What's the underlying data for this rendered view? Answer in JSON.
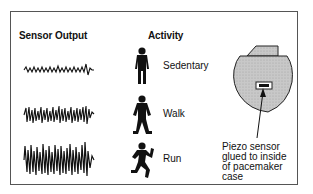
{
  "headers": {
    "sensor_output": "Sensor Output",
    "activity": "Activity"
  },
  "rows": [
    {
      "activity": "Sedentary",
      "icon": "standing-person-icon",
      "signal_amplitude": "low"
    },
    {
      "activity": "Walk",
      "icon": "walking-person-icon",
      "signal_amplitude": "medium"
    },
    {
      "activity": "Run",
      "icon": "running-person-icon",
      "signal_amplitude": "high"
    }
  ],
  "pacemaker": {
    "icon": "pacemaker-icon",
    "note_lines": [
      "Piezo sensor",
      "glued to inside",
      "of pacemaker",
      "case"
    ]
  },
  "colors": {
    "ink": "#111111",
    "pacemaker_fill": "#c8c8c8",
    "border": "#555555"
  }
}
